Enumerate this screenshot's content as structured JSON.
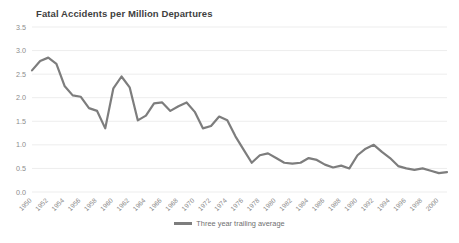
{
  "chart_data": {
    "type": "line",
    "title": "Fatal Accidents per Million Departures",
    "xlabel": "",
    "ylabel": "",
    "ylim": [
      0.0,
      3.5
    ],
    "ytick_step": 0.5,
    "ytick_labels": [
      "0.0",
      "0.5",
      "1.0",
      "1.5",
      "2.0",
      "2.5",
      "3.0",
      "3.5"
    ],
    "xlim": [
      1950,
      2001
    ],
    "xtick_labels": [
      "1950",
      "1952",
      "1954",
      "1956",
      "1958",
      "1960",
      "1962",
      "1964",
      "1966",
      "1968",
      "1970",
      "1972",
      "1974",
      "1976",
      "1978",
      "1980",
      "1982",
      "1984",
      "1986",
      "1988",
      "1990",
      "1992",
      "1994",
      "1996",
      "1998",
      "2000"
    ],
    "grid": "horizontal",
    "legend_position": "bottom-center",
    "line_color": "#7d7d7d",
    "grid_color": "#ededed",
    "series": [
      {
        "name": "Three  year trailing average",
        "x": [
          1950,
          1951,
          1952,
          1953,
          1954,
          1955,
          1956,
          1957,
          1958,
          1959,
          1960,
          1961,
          1962,
          1963,
          1964,
          1965,
          1966,
          1967,
          1968,
          1969,
          1970,
          1971,
          1972,
          1973,
          1974,
          1975,
          1976,
          1977,
          1978,
          1979,
          1980,
          1981,
          1982,
          1983,
          1984,
          1985,
          1986,
          1987,
          1988,
          1989,
          1990,
          1991,
          1992,
          1993,
          1994,
          1995,
          1996,
          1997,
          1998,
          1999,
          2000,
          2001
        ],
        "values": [
          2.58,
          2.78,
          2.85,
          2.72,
          2.25,
          2.05,
          2.02,
          1.78,
          1.72,
          1.35,
          2.2,
          2.45,
          2.22,
          1.52,
          1.62,
          1.88,
          1.9,
          1.72,
          1.82,
          1.9,
          1.7,
          1.35,
          1.4,
          1.6,
          1.52,
          1.18,
          0.9,
          0.62,
          0.78,
          0.82,
          0.72,
          0.62,
          0.6,
          0.62,
          0.72,
          0.68,
          0.58,
          0.52,
          0.56,
          0.5,
          0.78,
          0.92,
          1.0,
          0.85,
          0.72,
          0.55,
          0.5,
          0.47,
          0.5,
          0.45,
          0.4,
          0.42
        ]
      }
    ]
  },
  "legend": {
    "label": "Three  year trailing average"
  }
}
